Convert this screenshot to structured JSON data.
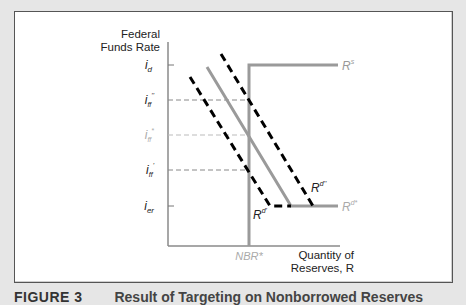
{
  "figure": {
    "caption_number": "FIGURE 3",
    "caption_title": "Result of Targeting on Nonborrowed Reserves"
  },
  "axes": {
    "y_label_line1": "Federal",
    "y_label_line2": "Funds Rate",
    "x_label_line1": "Quantity of",
    "x_label_line2": "Reserves, R",
    "y_ticks": [
      {
        "label": "i",
        "sub": "d",
        "sup": ""
      },
      {
        "label": "i",
        "sub": "ff",
        "sup": "''"
      },
      {
        "label": "i",
        "sub": "ff",
        "sup": "*"
      },
      {
        "label": "i",
        "sub": "ff",
        "sup": "'"
      },
      {
        "label": "i",
        "sub": "er",
        "sup": ""
      }
    ],
    "x_ticks": [
      {
        "label": "NBR*"
      }
    ]
  },
  "curves": {
    "supply": {
      "label": "R",
      "sup": "s",
      "color": "#999999"
    },
    "demand_star": {
      "label": "R",
      "sup": "d*",
      "color": "#999999"
    },
    "demand_high": {
      "label": "R",
      "sup": "d''",
      "color": "#000000"
    },
    "demand_low": {
      "label": "R",
      "sup": "d'",
      "color": "#000000"
    }
  },
  "colors": {
    "gray_line": "#9a9a9a",
    "light_label": "#aaaaaa",
    "black_dash": "#000000",
    "frame_bg": "#ffffff",
    "page_bg": "#e6e6e6"
  }
}
